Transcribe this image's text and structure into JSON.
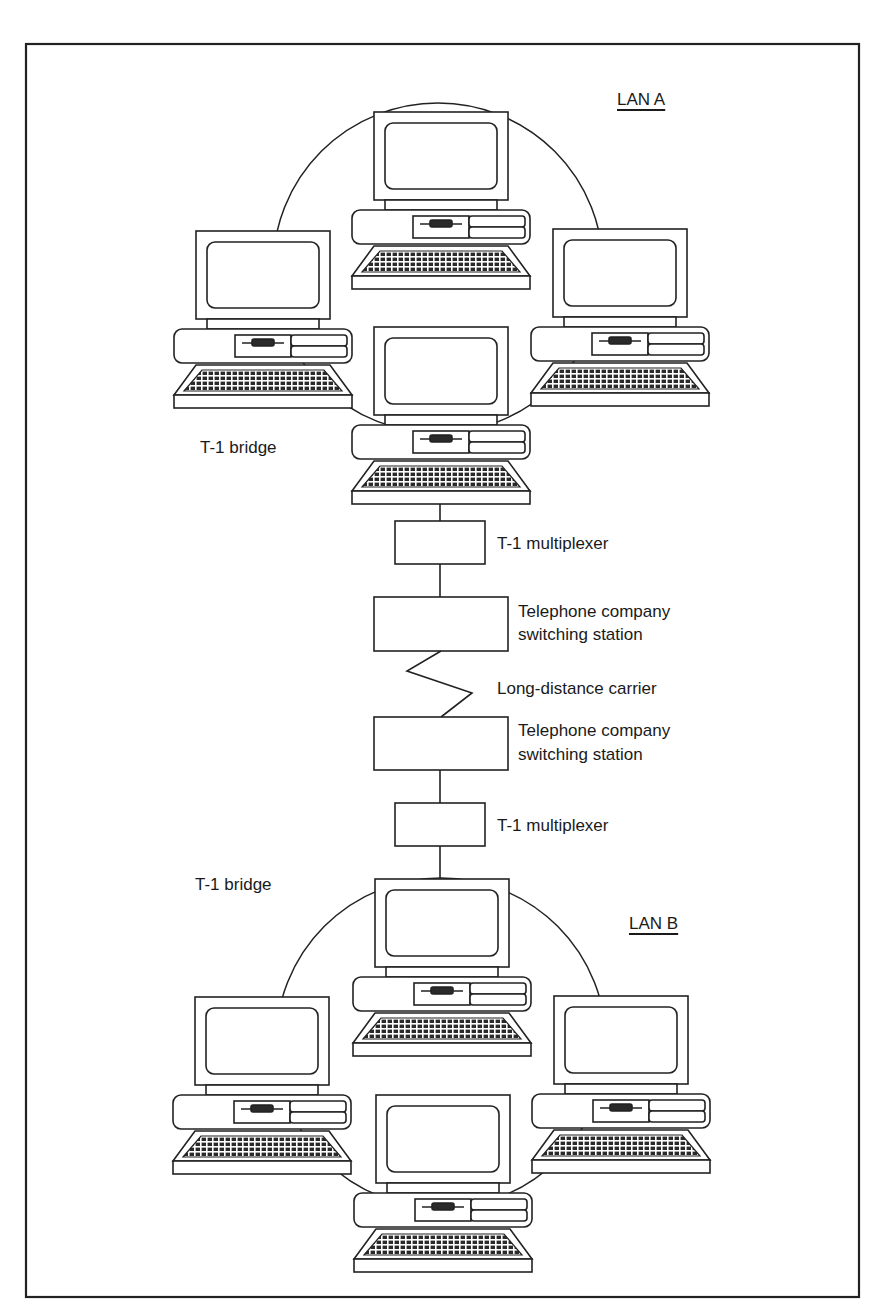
{
  "diagram": {
    "lan_a": {
      "label": "LAN A",
      "computers": [
        "top",
        "left",
        "right",
        "bottom"
      ],
      "bridge_label": "T-1 bridge"
    },
    "wan_link": {
      "mux_top_label": "T-1 multiplexer",
      "switch_top_label_line1": "Telephone company",
      "switch_top_label_line2": "switching station",
      "carrier_label": "Long-distance carrier",
      "switch_bottom_label_line1": "Telephone company",
      "switch_bottom_label_line2": "switching station",
      "mux_bottom_label": "T-1 multiplexer"
    },
    "lan_b": {
      "label": "LAN B",
      "computers": [
        "top",
        "left",
        "right",
        "bottom"
      ],
      "bridge_label": "T-1 bridge"
    },
    "colors": {
      "line": "#222222",
      "background": "#ffffff",
      "keyboard_keys": "#333333"
    }
  }
}
